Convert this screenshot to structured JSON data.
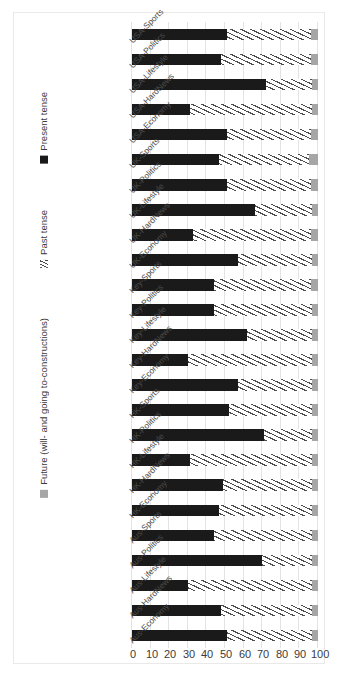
{
  "chart_data": {
    "type": "bar",
    "subtype": "stacked-horizontal-100",
    "title": "",
    "xlabel": "",
    "ylabel": "",
    "ylim": [
      0,
      100
    ],
    "grid": true,
    "legend_position": "bottom",
    "orientation": "rotated-90",
    "axis_direction": "100 at left, 0 at right",
    "ticks": [
      "100",
      "90",
      "80",
      "70",
      "60",
      "50",
      "40",
      "30",
      "20",
      "10",
      "0"
    ],
    "categories": [
      "USA-Sports",
      "USA-Politics",
      "USA-Lifestyle",
      "USA-HardNews",
      "USA-Economy",
      "UK-Sports",
      "UK-Politics",
      "UK-Lifestyle",
      "UK-HardNews",
      "UK-Economy",
      "Key-Sports",
      "Key-Politics",
      "Key-Lifestyle",
      "Key-HardNews",
      "Key-Economy",
      "HK-Sports",
      "HK-Politics",
      "HK-Lifestyle",
      "HK-HardNews",
      "HK-Economy",
      "Aus-Sports",
      "Aus-Politics",
      "Aus-Lifestyle",
      "Aus-HardNews",
      "Aus-Economy"
    ],
    "series": [
      {
        "name": "Present tense",
        "color": "#1a1a1a",
        "pattern": "solid",
        "values": [
          51,
          48,
          72,
          31,
          51,
          47,
          51,
          66,
          33,
          57,
          44,
          44,
          62,
          30,
          57,
          52,
          71,
          31,
          49,
          47,
          44,
          70,
          30,
          48,
          51
        ]
      },
      {
        "name": "Past tense",
        "color": "#4d4d4d",
        "pattern": "hatched",
        "values": [
          45,
          48,
          25,
          66,
          45,
          48,
          45,
          31,
          63,
          40,
          52,
          53,
          35,
          67,
          40,
          45,
          26,
          66,
          48,
          50,
          53,
          27,
          67,
          49,
          46
        ]
      },
      {
        "name": "Future (will- and going to-constructions)",
        "color": "#a6a6a6",
        "pattern": "solid",
        "values": [
          4,
          4,
          3,
          3,
          4,
          5,
          4,
          3,
          4,
          3,
          4,
          3,
          3,
          3,
          3,
          3,
          3,
          3,
          3,
          3,
          3,
          3,
          3,
          3,
          3
        ]
      }
    ]
  },
  "legend": {
    "items": [
      {
        "label": "Present tense",
        "swatch": "sw-present",
        "icon": "legend-swatch-present"
      },
      {
        "label": "Past tense",
        "swatch": "sw-past",
        "icon": "legend-swatch-past"
      },
      {
        "label": "Future (will- and going to-constructions)",
        "swatch": "sw-future",
        "icon": "legend-swatch-future"
      }
    ]
  }
}
